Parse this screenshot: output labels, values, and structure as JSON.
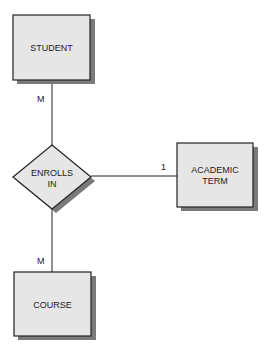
{
  "diagram": {
    "type": "entity-relationship",
    "entities": [
      {
        "id": "student",
        "label": "STUDENT"
      },
      {
        "id": "academic_term",
        "label_lines": [
          "ACADEMIC",
          "TERM"
        ]
      },
      {
        "id": "course",
        "label": "COURSE"
      }
    ],
    "relationship": {
      "id": "enrolls_in",
      "label_lines": [
        "ENROLLS",
        "IN"
      ]
    },
    "cardinalities": {
      "student": "M",
      "academic_term": "1",
      "course": "M"
    },
    "colors": {
      "fill": "#e6e6e6",
      "stroke": "#222222",
      "shadow": "#7a7a7a",
      "background": "#ffffff"
    }
  }
}
